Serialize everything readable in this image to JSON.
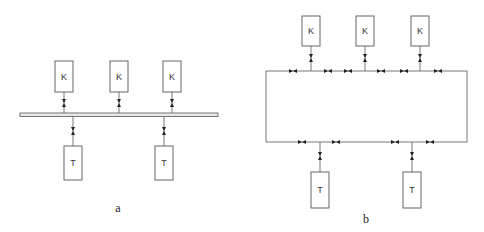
{
  "diagram_a": {
    "caption": "a",
    "top_nodes": [
      {
        "label": "K",
        "x": 55,
        "cx": 64
      },
      {
        "label": "K",
        "x": 110,
        "cx": 119
      },
      {
        "label": "K",
        "x": 163,
        "cx": 172
      }
    ],
    "bottom_nodes": [
      {
        "label": "T",
        "x": 64,
        "cx": 73
      },
      {
        "label": "T",
        "x": 155,
        "cx": 164
      }
    ]
  },
  "diagram_b": {
    "caption": "b",
    "top_nodes": [
      {
        "label": "K",
        "x": 302,
        "cx": 311
      },
      {
        "label": "K",
        "x": 356,
        "cx": 365
      },
      {
        "label": "K",
        "x": 411,
        "cx": 420
      }
    ],
    "bottom_nodes": [
      {
        "label": "T",
        "x": 311,
        "cx": 320
      },
      {
        "label": "T",
        "x": 403,
        "cx": 412
      }
    ],
    "ring_valves_top": [
      293,
      328,
      348,
      381,
      404,
      438
    ],
    "ring_valves_bottom": [
      302,
      336,
      395,
      430
    ]
  },
  "colors": {
    "line": "#555555",
    "bus_fill": "#e8e8e8",
    "valve": "#222222"
  }
}
